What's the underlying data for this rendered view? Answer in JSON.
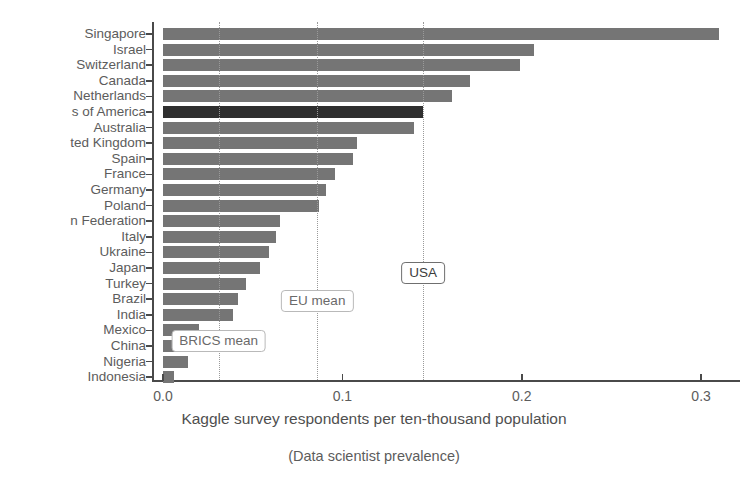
{
  "chart_data": {
    "type": "bar",
    "orientation": "horizontal",
    "title": "",
    "xlabel": "Kaggle survey respondents per ten-thousand population",
    "ylabel": "",
    "caption": "(Data scientist prevalence)",
    "xlim": [
      0.0,
      0.315
    ],
    "xticks": [
      0.0,
      0.1,
      0.2,
      0.3
    ],
    "xtick_labels": [
      "0.0",
      "0.1",
      "0.2",
      "0.3"
    ],
    "grid": false,
    "legend": "none",
    "bar_color": "#757575",
    "highlight_color": "#2f2f2f",
    "highlighted_category": "s of America",
    "categories": [
      "Singapore",
      "Israel",
      "Switzerland",
      "Canada",
      "Netherlands",
      "s of America",
      "Australia",
      "ted Kingdom",
      "Spain",
      "France",
      "Germany",
      "Poland",
      "n Federation",
      "Italy",
      "Ukraine",
      "Japan",
      "Turkey",
      "Brazil",
      "India",
      "Mexico",
      "China",
      "Nigeria",
      "Indonesia"
    ],
    "values": [
      0.31,
      0.207,
      0.199,
      0.171,
      0.161,
      0.145,
      0.14,
      0.108,
      0.106,
      0.096,
      0.091,
      0.087,
      0.065,
      0.063,
      0.059,
      0.054,
      0.046,
      0.042,
      0.039,
      0.02,
      0.015,
      0.014,
      0.006
    ],
    "annotations": [
      {
        "label": "BRICS mean",
        "value": 0.031,
        "emphasis": "light"
      },
      {
        "label": "EU mean",
        "value": 0.086,
        "emphasis": "light"
      },
      {
        "label": "USA",
        "value": 0.145,
        "emphasis": "strong"
      }
    ]
  }
}
